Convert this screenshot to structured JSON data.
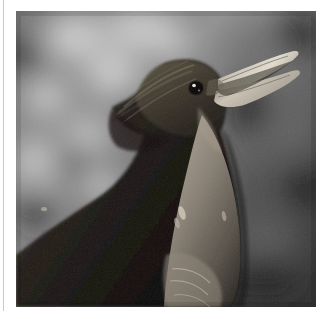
{
  "page": {
    "background_color": "#ffffff",
    "width": 329,
    "height": 319,
    "margin_rule_color": "#c9c9c9"
  },
  "photo": {
    "alt_description": "Close-up monochrome photograph of a small brown songbird (wren) in profile, head raised and beak open wide in song, perched against a softly blurred out-of-focus foliage background",
    "subject": "singing wren",
    "treatment": "grayscale",
    "frame": {
      "x": 16,
      "y": 11,
      "width": 300,
      "height": 296
    },
    "tones": {
      "background_light": "#d8d8d8",
      "background_mid": "#8a8a8a",
      "background_dark": "#2e2e2e",
      "background_darkest": "#141414",
      "bird_body_dark": "#1a1714",
      "bird_body_mid": "#4a433c",
      "bird_breast_light": "#9a9288",
      "bird_highlight": "#c4bcb0",
      "beak_light": "#d6d0c4",
      "eye_dark": "#0c0a08",
      "eye_catchlight": "#f2f0ea"
    },
    "features": [
      {
        "name": "open-beak",
        "x": 196,
        "y": 48
      },
      {
        "name": "eye",
        "x": 196,
        "y": 77
      },
      {
        "name": "crown",
        "x": 140,
        "y": 55
      },
      {
        "name": "throat",
        "x": 175,
        "y": 120
      },
      {
        "name": "breast",
        "x": 180,
        "y": 200
      },
      {
        "name": "wing",
        "x": 80,
        "y": 210
      }
    ]
  }
}
